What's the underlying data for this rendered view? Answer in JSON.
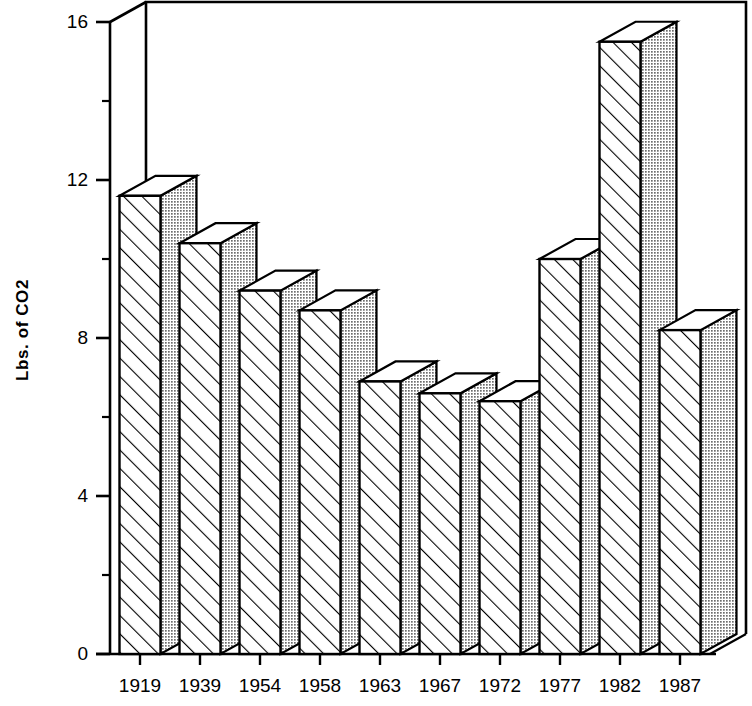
{
  "chart_data": {
    "type": "bar",
    "title": "",
    "subtitle": "",
    "xlabel": "",
    "ylabel": "Lbs. of CO2",
    "categories": [
      "1919",
      "1939",
      "1954",
      "1958",
      "1963",
      "1967",
      "1972",
      "1977",
      "1982",
      "1987"
    ],
    "values": [
      11.6,
      10.4,
      9.2,
      8.7,
      6.9,
      6.6,
      6.4,
      10.0,
      15.5,
      8.2
    ],
    "ylim": [
      0,
      16
    ],
    "ytick_labels": [
      "0",
      "4",
      "8",
      "12",
      "16"
    ],
    "ytick_values": [
      0,
      4,
      8,
      12,
      16
    ],
    "yminor_tick_values": [
      2,
      6,
      10,
      14
    ],
    "grid": false,
    "legend": false,
    "legend_position": "none",
    "style": {
      "bar_fill": "#ffffff",
      "bar_hatch": "diagonal-forward",
      "bar_side_fill": "#b0b0b0",
      "bar_top_fill": "#ffffff",
      "outline": "#000000",
      "background": "#ffffff",
      "three_d": true
    }
  },
  "axes": {
    "y_axis_label": "Lbs. of CO2",
    "y_axis_name": "y-axis",
    "x_axis_name": "x-axis"
  }
}
